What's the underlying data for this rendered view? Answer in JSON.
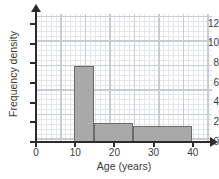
{
  "chart_data": {
    "type": "bar",
    "title": "",
    "xlabel": "Age (years)",
    "ylabel": "Frequency density",
    "xlim": [
      0,
      45
    ],
    "ylim": [
      0,
      13
    ],
    "grid": true,
    "legend": null,
    "xticks": [
      "0",
      "10",
      "20",
      "30",
      "40"
    ],
    "xtick_values": [
      0,
      10,
      20,
      30,
      40
    ],
    "yticks": [
      "0",
      "2",
      "4",
      "6",
      "8",
      "10",
      "12"
    ],
    "ytick_values": [
      0,
      2,
      4,
      6,
      8,
      10,
      12
    ],
    "bars": [
      {
        "label": "10-15",
        "x_start": 10,
        "x_end": 15,
        "value": 7.6
      },
      {
        "label": "15-25",
        "x_start": 15,
        "x_end": 25,
        "value": 1.8
      },
      {
        "label": "25-40",
        "x_start": 25,
        "x_end": 40,
        "value": 1.5
      }
    ],
    "categories": [
      "10-15",
      "15-25",
      "25-40"
    ],
    "values": [
      7.6,
      1.8,
      1.5
    ],
    "colors": {
      "bar_fill": "#a9a9a9",
      "bar_edge": "#6a6a6a",
      "axis": "#2b2b2b",
      "grid_major": "#c9cdd2",
      "grid_minor": "#e4e7ea",
      "text": "#3a3a3a",
      "background": "#ffffff"
    }
  }
}
